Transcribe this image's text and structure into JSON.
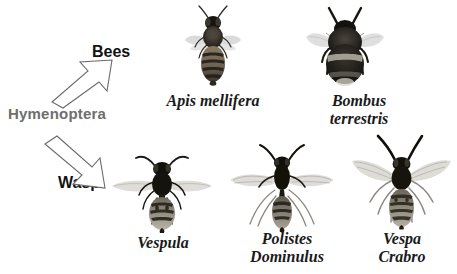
{
  "figure": {
    "background_color": "#ffffff",
    "order_label": "Hymenoptera",
    "order_label_color": "#6e6e6e",
    "group_label_color": "#121212",
    "caption_color": "#1a1a1a",
    "groups": [
      {
        "id": "bees",
        "label": "Bees",
        "arrow": "up-right-block-arrow"
      },
      {
        "id": "wasp",
        "label": "Wasp",
        "arrow": "down-right-block-arrow"
      }
    ],
    "specimens": [
      {
        "id": "apis-mellifera",
        "group": "bees",
        "caption_lines": [
          "Apis mellifera"
        ],
        "icon": "honeybee-dorsal-photo"
      },
      {
        "id": "bombus-terrestris",
        "group": "bees",
        "caption_lines": [
          "Bombus",
          "terrestris"
        ],
        "icon": "bumblebee-dorsal-photo"
      },
      {
        "id": "vespula",
        "group": "wasp",
        "caption_lines": [
          "Vespula"
        ],
        "icon": "vespula-wasp-dorsal-photo"
      },
      {
        "id": "polistes-dominulus",
        "group": "wasp",
        "caption_lines": [
          "Polistes",
          "Dominulus"
        ],
        "icon": "polistes-wasp-dorsal-photo"
      },
      {
        "id": "vespa-crabro",
        "group": "wasp",
        "caption_lines": [
          "Vespa",
          "Crabro"
        ],
        "icon": "hornet-dorsal-photo"
      }
    ]
  }
}
